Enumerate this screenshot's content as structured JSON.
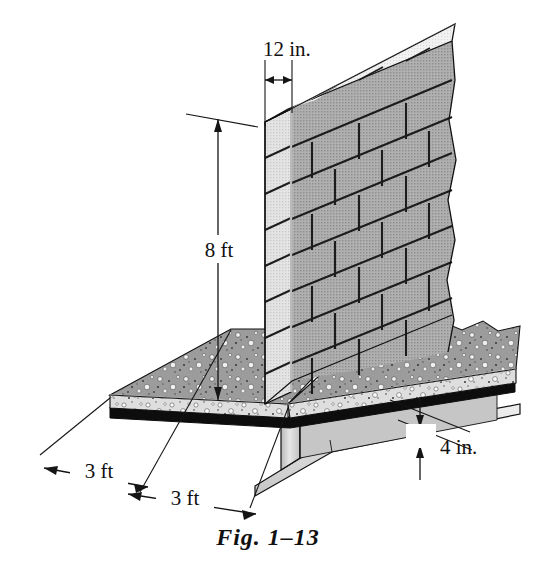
{
  "figure": {
    "caption": "Fig. 1–13",
    "background_color": "#ffffff",
    "ink_color": "#111111"
  },
  "dimensions": [
    {
      "id": "wall-thickness",
      "label": "12 in.",
      "value": 12,
      "unit": "in.",
      "describes": "wall thickness",
      "orientation": "horizontal"
    },
    {
      "id": "wall-height",
      "label": "8 ft",
      "value": 8,
      "unit": "ft",
      "describes": "wall height",
      "orientation": "vertical"
    },
    {
      "id": "slab-left-span",
      "label": "3 ft",
      "value": 3,
      "unit": "ft",
      "describes": "slab overhang left of wall",
      "orientation": "isometric-depth"
    },
    {
      "id": "slab-right-span",
      "label": "3 ft",
      "value": 3,
      "unit": "ft",
      "describes": "slab overhang right of wall",
      "orientation": "isometric-depth"
    },
    {
      "id": "slab-thickness",
      "label": "4 in.",
      "value": 4,
      "unit": "in.",
      "describes": "concrete slab thickness",
      "orientation": "vertical"
    }
  ],
  "components": {
    "wall": {
      "name": "concrete block masonry wall",
      "courses": 8,
      "bond": "running bond",
      "face_color": "#a8a8a8",
      "end_color": "#e2e2e2",
      "top_color": "#f2f2f2",
      "joint_color": "#1a1a1a"
    },
    "slab": {
      "name": "reinforced concrete slab",
      "top_color": "#9e9e9e",
      "edge_color": "#dcdcdc",
      "underside_color": "#101010",
      "aggregate_color": "#f4f4f4"
    },
    "beam": {
      "name": "steel wide-flange I-beam",
      "web_color": "#cfcfcf",
      "flange_color": "#e8e8e8",
      "shadow_color": "#9a9a9a"
    }
  },
  "colors": {
    "accent": "#111111",
    "paper": "#ffffff",
    "block_face": "#a8a8a8",
    "block_end": "#e2e2e2",
    "concrete_top": "#9e9e9e",
    "concrete_edge": "#dcdcdc",
    "steel": "#d6d6d6"
  }
}
